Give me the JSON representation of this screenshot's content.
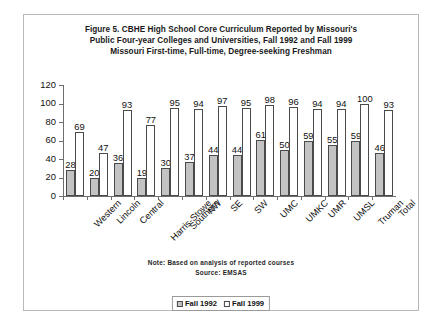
{
  "figure": {
    "title_lines": [
      "Figure 5. CBHE High School Core Curriculum Reported by Missouri's",
      "Public Four-year Colleges and Universities, Fall 1992 and Fall 1999",
      "Missouri First-time, Full-time, Degree-seeking Freshman"
    ],
    "note": "Note: Based on analysis of reported courses",
    "source": "Source: EMSAS"
  },
  "legend": {
    "entries": [
      {
        "label": "Fall 1992",
        "color": "#c3c3c3"
      },
      {
        "label": "Fall 1999",
        "color": "#ffffff"
      }
    ]
  },
  "chart_data": {
    "type": "bar",
    "title": "Figure 5. CBHE High School Core Curriculum Reported by Missouri's Public Four-year Colleges and Universities, Fall 1992 and Fall 1999 Missouri First-time, Full-time, Degree-seeking Freshman",
    "xlabel": "",
    "ylabel": "",
    "ylim": [
      0,
      120
    ],
    "yticks": [
      0,
      20,
      40,
      60,
      80,
      100,
      120
    ],
    "grid": false,
    "legend_position": "bottom",
    "categories": [
      "Western",
      "Lincoln",
      "Central",
      "Harris-Stowe",
      "Southern",
      "NW",
      "SE",
      "SW",
      "UMC",
      "UMKC",
      "UMR",
      "UMSL",
      "Truman",
      "Total"
    ],
    "series": [
      {
        "name": "Fall 1992",
        "color": "#c3c3c3",
        "values": [
          28,
          20,
          36,
          19,
          30,
          37,
          44,
          44,
          61,
          50,
          59,
          55,
          59,
          46
        ]
      },
      {
        "name": "Fall 1999",
        "color": "#ffffff",
        "values": [
          69,
          47,
          93,
          77,
          95,
          94,
          97,
          95,
          98,
          96,
          94,
          94,
          100,
          93
        ]
      }
    ]
  }
}
